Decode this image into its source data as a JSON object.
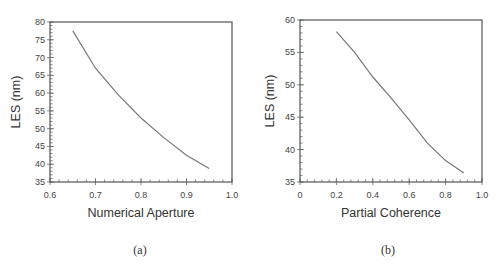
{
  "chart_data": [
    {
      "type": "line",
      "title": "",
      "caption": "(a)",
      "xlabel": "Numerical Aperture",
      "ylabel": "LES (nm)",
      "xlim": [
        0.6,
        1.0
      ],
      "ylim": [
        35,
        80
      ],
      "xticks": [
        "0.6",
        "0.7",
        "0.8",
        "0.9",
        "1.0"
      ],
      "xtick_values": [
        0.6,
        0.7,
        0.8,
        0.9,
        1.0
      ],
      "x_minor_step": 0.02,
      "yticks": [
        "35",
        "40",
        "45",
        "50",
        "55",
        "60",
        "65",
        "70",
        "75",
        "80"
      ],
      "ytick_values": [
        35,
        40,
        45,
        50,
        55,
        60,
        65,
        70,
        75,
        80
      ],
      "y_minor_step": 1,
      "grid": false,
      "legend": "none",
      "series": [
        {
          "name": "LES vs NA",
          "x": [
            0.65,
            0.7,
            0.75,
            0.8,
            0.85,
            0.9,
            0.95
          ],
          "values": [
            77.5,
            67.0,
            59.5,
            53.0,
            47.5,
            42.5,
            38.8
          ]
        }
      ]
    },
    {
      "type": "line",
      "title": "",
      "caption": "(b)",
      "xlabel": "Partial Coherence",
      "ylabel": "LES (nm)",
      "xlim": [
        0,
        1.0
      ],
      "ylim": [
        35,
        60
      ],
      "xticks": [
        "0",
        "0.2",
        "0.4",
        "0.6",
        "0.8",
        "1.0"
      ],
      "xtick_values": [
        0,
        0.2,
        0.4,
        0.6,
        0.8,
        1.0
      ],
      "x_minor_step": 0.04,
      "yticks": [
        "35",
        "40",
        "45",
        "50",
        "55",
        "60"
      ],
      "ytick_values": [
        35,
        40,
        45,
        50,
        55,
        60
      ],
      "y_minor_step": 1,
      "grid": false,
      "legend": "none",
      "series": [
        {
          "name": "LES vs Partial Coherence",
          "x": [
            0.2,
            0.3,
            0.4,
            0.5,
            0.6,
            0.7,
            0.8,
            0.9
          ],
          "values": [
            58.2,
            55.0,
            51.2,
            48.0,
            44.6,
            41.0,
            38.3,
            36.4
          ]
        }
      ]
    }
  ]
}
